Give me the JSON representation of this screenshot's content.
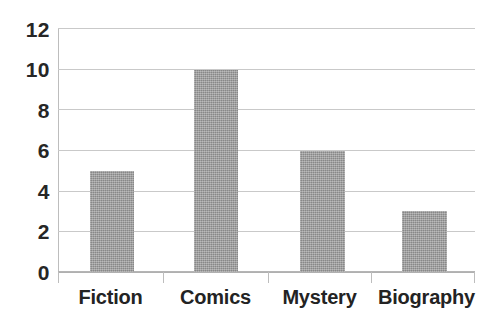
{
  "chart_data": {
    "type": "bar",
    "title": "",
    "subtitle": "",
    "xlabel": "",
    "ylabel": "",
    "categories": [
      "Fiction",
      "Comics",
      "Mystery",
      "Biography"
    ],
    "values": [
      5,
      10,
      6,
      3
    ],
    "series": [
      {
        "name": "",
        "values": [
          5,
          10,
          6,
          3
        ]
      }
    ],
    "ylim": [
      0,
      12
    ],
    "ytick_labels": [
      "12",
      "10",
      "8",
      "6",
      "4",
      "2",
      "0"
    ],
    "ytick_values": [
      12,
      10,
      8,
      6,
      4,
      2,
      0
    ],
    "ytick_step": 2,
    "grid": true,
    "grid_axis": "y",
    "legend": false,
    "legend_position": "none",
    "annotations": [],
    "colors": {
      "bar_fill": "#9b9b9b",
      "gridline": "#c9c9c9",
      "axis_line": "#bdbdbd",
      "tick_label_text": "#262626",
      "category_label_text": "#232323",
      "background": "#ffffff"
    }
  }
}
